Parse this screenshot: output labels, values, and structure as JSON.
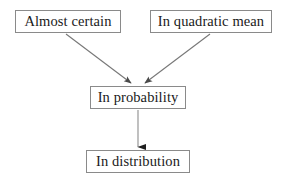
{
  "diagram": {
    "type": "flowchart",
    "background_color": "#ffffff",
    "line_color": "#6e6e6e",
    "box_border_color": "#8a8a8a",
    "text_color": "#1a1a1a",
    "nodes": [
      {
        "id": "almost_certain",
        "label": "Almost certain",
        "x": 15,
        "y": 10,
        "width": 106,
        "height": 23
      },
      {
        "id": "quadratic_mean",
        "label": "In quadratic mean",
        "x": 150,
        "y": 10,
        "width": 122,
        "height": 23
      },
      {
        "id": "in_probability",
        "label": "In probability",
        "x": 90,
        "y": 86,
        "width": 96,
        "height": 23
      },
      {
        "id": "in_distribution",
        "label": "In distribution",
        "x": 86,
        "y": 150,
        "width": 104,
        "height": 23
      }
    ],
    "edges": [
      {
        "id": "edge_ac_to_ip",
        "from": "almost_certain",
        "to": "in_probability",
        "style": "solid-arrow",
        "x1": 66,
        "y1": 34,
        "x2": 131,
        "y2": 83
      },
      {
        "id": "edge_qm_to_ip",
        "from": "quadratic_mean",
        "to": "in_probability",
        "style": "solid-arrow",
        "x1": 210,
        "y1": 34,
        "x2": 145,
        "y2": 83
      },
      {
        "id": "edge_ip_to_id",
        "from": "in_probability",
        "to": "in_distribution",
        "style": "solid-arrow",
        "x1": 138,
        "y1": 110,
        "x2": 138,
        "y2": 148
      }
    ]
  }
}
